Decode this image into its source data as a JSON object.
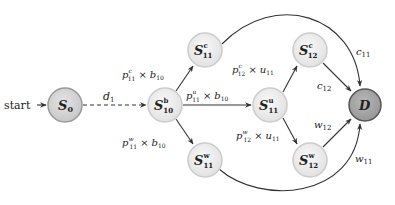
{
  "diagram": {
    "start_label": "start",
    "nodes": {
      "s0": {
        "base": "S",
        "sub": "0",
        "sup": ""
      },
      "s10b": {
        "base": "S",
        "sub": "10",
        "sup": "b"
      },
      "s11c": {
        "base": "S",
        "sub": "11",
        "sup": "c"
      },
      "s11u": {
        "base": "S",
        "sub": "11",
        "sup": "u"
      },
      "s11w": {
        "base": "S",
        "sub": "11",
        "sup": "w"
      },
      "s12c": {
        "base": "S",
        "sub": "12",
        "sup": "c"
      },
      "s12w": {
        "base": "S",
        "sub": "12",
        "sup": "w"
      },
      "d": {
        "base": "D",
        "sub": "",
        "sup": ""
      }
    },
    "edges": {
      "d1": {
        "base": "d",
        "sub": "1"
      },
      "s10_s11c": {
        "p": "p",
        "psup": "c",
        "psub": "11",
        "times": "×",
        "b": "b",
        "bsub": "10"
      },
      "s10_s11u": {
        "p": "p",
        "psup": "u",
        "psub": "11",
        "times": "×",
        "b": "b",
        "bsub": "10"
      },
      "s10_s11w": {
        "p": "p",
        "psup": "w",
        "psub": "11",
        "times": "×",
        "b": "b",
        "bsub": "10"
      },
      "s11u_s12c": {
        "p": "p",
        "psup": "c",
        "psub": "12",
        "times": "×",
        "b": "u",
        "bsub": "11"
      },
      "s11u_s12w": {
        "p": "p",
        "psup": "w",
        "psub": "12",
        "times": "×",
        "b": "u",
        "bsub": "11"
      },
      "c11": {
        "base": "c",
        "sub": "11"
      },
      "c12": {
        "base": "c",
        "sub": "12"
      },
      "w12": {
        "base": "w",
        "sub": "12"
      },
      "w11": {
        "base": "w",
        "sub": "11"
      }
    },
    "colors": {
      "node_fill": "#ececec",
      "node_stroke": "#c8c8c8",
      "start_node_fill": "#d6d6d6",
      "start_node_stroke": "#9a9a9a",
      "end_node_fill": "#a8a8a8",
      "end_node_stroke": "#555555",
      "edge": "#333333"
    }
  }
}
